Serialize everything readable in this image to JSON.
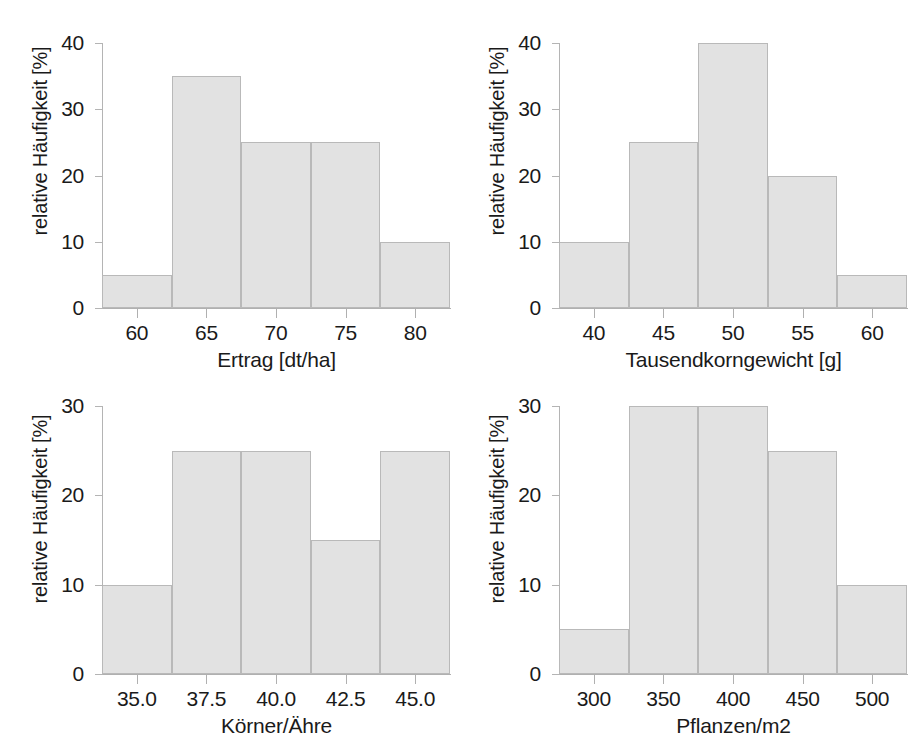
{
  "figure": {
    "background": "#ffffff",
    "bar_fill": "#e2e2e2",
    "bar_stroke": "#b9b9b9",
    "axis_color": "#b0b0b0",
    "text_color": "#1a1a1a",
    "layout": "2x2 grid of histograms"
  },
  "chart_data": [
    {
      "type": "bar",
      "id": "ertrag",
      "title": "",
      "xlabel": "Ertrag [dt/ha]",
      "ylabel": "relative Häufigkeit [%]",
      "xlim": [
        57.5,
        82.5
      ],
      "ylim": [
        0,
        40
      ],
      "xticks": [
        60,
        65,
        70,
        75,
        80
      ],
      "xticklabels": [
        "60",
        "65",
        "70",
        "75",
        "80"
      ],
      "yticks": [
        0,
        10,
        20,
        30,
        40
      ],
      "yticklabels": [
        "0",
        "10",
        "20",
        "30",
        "40"
      ],
      "grid": false,
      "legend": "none",
      "bin_edges": [
        57.5,
        62.5,
        67.5,
        72.5,
        77.5,
        82.5
      ],
      "categories": [
        "57.5-62.5",
        "62.5-67.5",
        "67.5-72.5",
        "72.5-77.5",
        "77.5-82.5"
      ],
      "values": [
        5,
        35,
        25,
        25,
        10
      ]
    },
    {
      "type": "bar",
      "id": "tausendkorngewicht",
      "title": "",
      "xlabel": "Tausendkorngewicht [g]",
      "ylabel": "relative Häufigkeit [%]",
      "xlim": [
        37.5,
        62.5
      ],
      "ylim": [
        0,
        40
      ],
      "xticks": [
        40,
        45,
        50,
        55,
        60
      ],
      "xticklabels": [
        "40",
        "45",
        "50",
        "55",
        "60"
      ],
      "yticks": [
        0,
        10,
        20,
        30,
        40
      ],
      "yticklabels": [
        "0",
        "10",
        "20",
        "30",
        "40"
      ],
      "grid": false,
      "legend": "none",
      "bin_edges": [
        37.5,
        42.5,
        47.5,
        52.5,
        57.5,
        62.5
      ],
      "categories": [
        "37.5-42.5",
        "42.5-47.5",
        "47.5-52.5",
        "52.5-57.5",
        "57.5-62.5"
      ],
      "values": [
        10,
        25,
        40,
        20,
        5
      ]
    },
    {
      "type": "bar",
      "id": "koerner-aehre",
      "title": "",
      "xlabel": "Körner/Ähre",
      "ylabel": "relative Häufigkeit [%]",
      "xlim": [
        33.75,
        46.25
      ],
      "ylim": [
        0,
        30
      ],
      "xticks": [
        35.0,
        37.5,
        40.0,
        42.5,
        45.0
      ],
      "xticklabels": [
        "35.0",
        "37.5",
        "40.0",
        "42.5",
        "45.0"
      ],
      "yticks": [
        0,
        10,
        20,
        30
      ],
      "yticklabels": [
        "0",
        "10",
        "20",
        "30"
      ],
      "grid": false,
      "legend": "none",
      "bin_edges": [
        33.75,
        36.25,
        38.75,
        41.25,
        43.75,
        46.25
      ],
      "categories": [
        "33.75-36.25",
        "36.25-38.75",
        "38.75-41.25",
        "41.25-43.75",
        "43.75-46.25"
      ],
      "values": [
        10,
        25,
        25,
        15,
        25
      ]
    },
    {
      "type": "bar",
      "id": "pflanzen-m2",
      "title": "",
      "xlabel": "Pflanzen/m2",
      "ylabel": "relative Häufigkeit [%]",
      "xlim": [
        275,
        525
      ],
      "ylim": [
        0,
        30
      ],
      "xticks": [
        300,
        350,
        400,
        450,
        500
      ],
      "xticklabels": [
        "300",
        "350",
        "400",
        "450",
        "500"
      ],
      "yticks": [
        0,
        10,
        20,
        30
      ],
      "yticklabels": [
        "0",
        "10",
        "20",
        "30"
      ],
      "grid": false,
      "legend": "none",
      "bin_edges": [
        275,
        325,
        375,
        425,
        475,
        525
      ],
      "categories": [
        "275-325",
        "325-375",
        "375-425",
        "425-475",
        "475-525"
      ],
      "values": [
        5,
        30,
        30,
        25,
        10
      ]
    }
  ]
}
